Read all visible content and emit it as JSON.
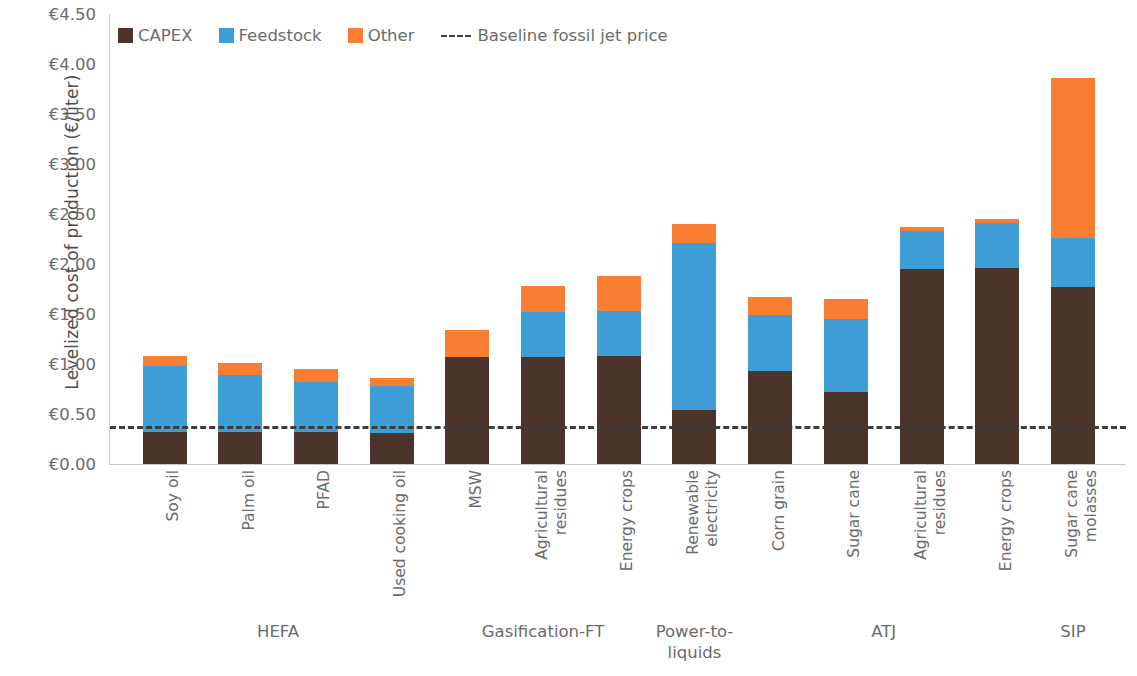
{
  "chart_data": {
    "type": "bar",
    "subtype": "stacked-bar",
    "title": "",
    "xlabel": "",
    "ylabel": "Levelized cost of production (€/liter)",
    "ylim": [
      0,
      4.5
    ],
    "ytick_labels": [
      "€0.00",
      "€0.50",
      "€1.00",
      "€1.50",
      "€2.00",
      "€2.50",
      "€3.00",
      "€3.50",
      "€4.00",
      "€4.50"
    ],
    "ytick_values": [
      0,
      0.5,
      1.0,
      1.5,
      2.0,
      2.5,
      3.0,
      3.5,
      4.0,
      4.5
    ],
    "grid": false,
    "legend_position": "top-left",
    "categories": [
      "Soy oil",
      "Palm oil",
      "PFAD",
      "Used cooking oil",
      "MSW",
      "Agricultural residues",
      "Energy crops",
      "Renewable electricity",
      "Corn grain",
      "Sugar cane",
      "Agricultural residues",
      "Energy crops",
      "Sugar cane molasses"
    ],
    "category_lines": [
      [
        "Soy oil"
      ],
      [
        "Palm oil"
      ],
      [
        "PFAD"
      ],
      [
        "Used cooking oil"
      ],
      [
        "MSW"
      ],
      [
        "Agricultural",
        "residues"
      ],
      [
        "Energy crops"
      ],
      [
        "Renewable",
        "electricity"
      ],
      [
        "Corn grain"
      ],
      [
        "Sugar cane"
      ],
      [
        "Agricultural",
        "residues"
      ],
      [
        "Energy crops"
      ],
      [
        "Sugar cane",
        "molasses"
      ]
    ],
    "series": [
      {
        "name": "CAPEX",
        "color": "#4a342c",
        "values": [
          0.32,
          0.32,
          0.32,
          0.31,
          1.07,
          1.07,
          1.08,
          0.54,
          0.93,
          0.72,
          1.95,
          1.96,
          1.77
        ]
      },
      {
        "name": "Feedstock",
        "color": "#3d9dd4",
        "values": [
          0.66,
          0.57,
          0.5,
          0.47,
          0.0,
          0.45,
          0.45,
          1.67,
          0.56,
          0.73,
          0.38,
          0.45,
          0.49
        ]
      },
      {
        "name": "Other",
        "color": "#f97e32",
        "values": [
          0.1,
          0.12,
          0.13,
          0.08,
          0.27,
          0.26,
          0.35,
          0.19,
          0.18,
          0.2,
          0.04,
          0.04,
          1.6
        ]
      }
    ],
    "totals": [
      1.08,
      1.01,
      0.95,
      0.86,
      1.34,
      1.78,
      1.88,
      2.4,
      1.67,
      1.65,
      2.37,
      2.45,
      3.86
    ],
    "reference_line": {
      "label": "Baseline fossil jet price",
      "value": 0.38,
      "style": "dashed",
      "color": "#3d3d3d"
    },
    "groups": [
      {
        "label": "HEFA",
        "start": 0,
        "end": 3
      },
      {
        "label": "Gasification-FT",
        "start": 4,
        "end": 6
      },
      {
        "label": "Power-to-\nliquids",
        "start": 7,
        "end": 7
      },
      {
        "label": "ATJ",
        "start": 8,
        "end": 11
      },
      {
        "label": "SIP",
        "start": 12,
        "end": 12
      }
    ]
  },
  "legend": {
    "items": [
      {
        "label": "CAPEX",
        "color": "#4a342c",
        "icon": "square-swatch"
      },
      {
        "label": "Feedstock",
        "color": "#3d9dd4",
        "icon": "square-swatch"
      },
      {
        "label": "Other",
        "color": "#f97e32",
        "icon": "square-swatch"
      }
    ],
    "reference_label": "Baseline fossil jet price",
    "reference_icon": "dashed-line"
  },
  "axes": {
    "y_title": "Levelized cost of production (€/liter)"
  }
}
